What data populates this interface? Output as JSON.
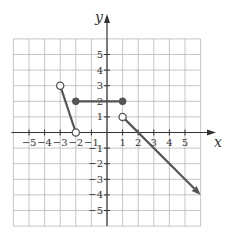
{
  "chart_data": {
    "type": "line",
    "title": "",
    "xlabel": "x",
    "ylabel": "y",
    "xlim": [
      -6,
      6
    ],
    "ylim": [
      -6,
      6
    ],
    "grid": true,
    "x_ticks": [
      -5,
      -4,
      -3,
      -2,
      -1,
      1,
      2,
      3,
      4,
      5
    ],
    "y_ticks": [
      5,
      4,
      3,
      2,
      1,
      -1,
      -2,
      -3,
      -4,
      -5
    ],
    "x_tick_labels": [
      "−5",
      "−4",
      "−3",
      "−2",
      "−1",
      "1",
      "2",
      "3",
      "4",
      "5"
    ],
    "y_tick_labels": [
      "5",
      "4",
      "3",
      "2",
      "1",
      "−1",
      "−2",
      "−3",
      "−4",
      "−5"
    ],
    "series": [
      {
        "name": "segment-1",
        "points": [
          [
            -3,
            3
          ],
          [
            -2,
            0
          ]
        ],
        "start": "open",
        "end": "open"
      },
      {
        "name": "segment-2",
        "points": [
          [
            -2,
            2
          ],
          [
            1,
            2
          ]
        ],
        "start": "closed",
        "end": "closed"
      },
      {
        "name": "ray-3",
        "points": [
          [
            1,
            1
          ],
          [
            6,
            -4
          ]
        ],
        "start": "open",
        "end": "arrow"
      }
    ],
    "colors": {
      "grid": "#b8b8b8",
      "axis": "#333333",
      "curve": "#555555",
      "open_fill": "#ffffff"
    }
  }
}
